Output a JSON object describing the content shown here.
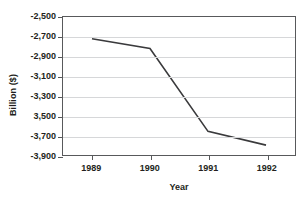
{
  "chart_data": {
    "type": "line",
    "title": "",
    "xlabel": "Year",
    "ylabel": "Billion ($)",
    "categories": [
      "1989",
      "1990",
      "1991",
      "1992"
    ],
    "x": [
      1989,
      1990,
      1991,
      1992
    ],
    "values": [
      -2720,
      -2820,
      -3660,
      -3800
    ],
    "series": [
      {
        "name": "",
        "values": [
          -2720,
          -2820,
          -3660,
          -3800
        ]
      }
    ],
    "ylim": [
      -2500,
      -3900
    ],
    "y_axis_inverted": true,
    "y_tick_step": 200,
    "y_tick_values": [
      -3900,
      -3700,
      -3500,
      -3300,
      -3100,
      -2900,
      -2700,
      -2500
    ],
    "y_tick_labels": [
      "-3,900",
      "-3,700",
      "3,500",
      "-3,300",
      "-3,100",
      "-2,900",
      "-2,700",
      "-2,500"
    ],
    "x_tick_labels": [
      "1989",
      "1990",
      "1991",
      "1992"
    ],
    "grid": true,
    "grid_axis": "y",
    "legend": false,
    "legend_position": "none",
    "markers": false,
    "colors": {
      "line": "#3a3a3c",
      "grid": "#d6d7d9",
      "axis": "#58595b",
      "text": "#231f20",
      "background": "#ffffff"
    }
  }
}
